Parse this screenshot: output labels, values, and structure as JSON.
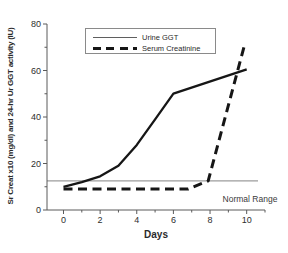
{
  "figure": {
    "background": "#ffffff"
  },
  "chart_data": {
    "type": "line",
    "title": "",
    "xlabel": "Days",
    "ylabel": "Sr Creat x10 (mg/dl) and 24-hr Ur GGT activity (IU)",
    "xlim": [
      -0.9,
      11
    ],
    "ylim": [
      0,
      80
    ],
    "x_ticks_major": [
      0,
      2,
      4,
      6,
      8,
      10
    ],
    "x_ticks_minor": [
      1,
      3,
      5,
      7,
      9,
      11
    ],
    "y_ticks_major": [
      0,
      20,
      40,
      60,
      80
    ],
    "y_ticks_minor": [
      10,
      30,
      50,
      70
    ],
    "grid": false,
    "legend_position": "top-left-inside",
    "axis_color": "#5a5a5a",
    "text_color": "#2e2e2e",
    "reference_line": {
      "label": "Normal Range",
      "value": 12.5,
      "color": "#9c9c9c"
    },
    "series": [
      {
        "name": "Urine GGT",
        "line_style": "solid",
        "color": "#161616",
        "width": 2.3,
        "points": [
          [
            0,
            10
          ],
          [
            1,
            12
          ],
          [
            2,
            14.5
          ],
          [
            3,
            19
          ],
          [
            4,
            28
          ],
          [
            5,
            39
          ],
          [
            6,
            50
          ],
          [
            10,
            60.5
          ]
        ]
      },
      {
        "name": "Serum Creatinine",
        "line_style": "dashed",
        "color": "#161616",
        "width": 3,
        "points": [
          [
            0,
            9
          ],
          [
            6.8,
            9
          ],
          [
            7.9,
            12.5
          ],
          [
            9.85,
            70
          ]
        ]
      }
    ]
  }
}
